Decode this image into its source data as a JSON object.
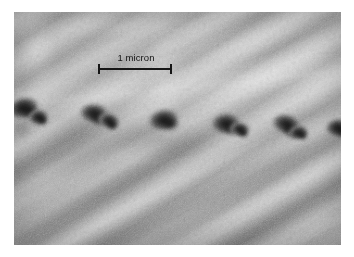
{
  "figure": {
    "kind": "electron-micrograph",
    "background_color": "#ffffff",
    "plate": {
      "x": 14,
      "y": 12,
      "width": 327,
      "height": 233,
      "base_color": "#b4b4b4",
      "darkest_tone": "#171717",
      "lightest_tone": "#d2d2d2"
    }
  },
  "scale_bar": {
    "label": "1 micron",
    "length_px": 74,
    "x": 97,
    "y": 52,
    "color": "#161616",
    "cap_height_px": 10
  },
  "texture": {
    "striation_angle_deg": 148,
    "description": "diagonal fibrous striations running upper-left to lower-right"
  },
  "particles": [
    {
      "cx": 26,
      "cy": 110,
      "rx": 20,
      "ry": 15
    },
    {
      "cx": 40,
      "cy": 119,
      "rx": 13,
      "ry": 11
    },
    {
      "cx": 96,
      "cy": 116,
      "rx": 19,
      "ry": 14
    },
    {
      "cx": 110,
      "cy": 123,
      "rx": 14,
      "ry": 11
    },
    {
      "cx": 166,
      "cy": 122,
      "rx": 20,
      "ry": 15
    },
    {
      "cx": 228,
      "cy": 126,
      "rx": 19,
      "ry": 15
    },
    {
      "cx": 241,
      "cy": 131,
      "rx": 13,
      "ry": 10
    },
    {
      "cx": 288,
      "cy": 127,
      "rx": 19,
      "ry": 14
    },
    {
      "cx": 300,
      "cy": 134,
      "rx": 13,
      "ry": 10
    },
    {
      "cx": 340,
      "cy": 130,
      "rx": 16,
      "ry": 13
    }
  ]
}
